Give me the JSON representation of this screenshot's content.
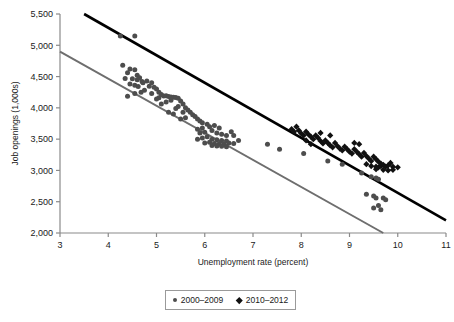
{
  "chart_data": {
    "type": "scatter",
    "title": "",
    "xlabel": "Unemployment rate (percent)",
    "ylabel": "Job openings (1,000s)",
    "xlim": [
      3,
      11
    ],
    "ylim": [
      2000,
      5500
    ],
    "xticks": [
      3,
      4,
      5,
      6,
      7,
      8,
      9,
      10,
      11
    ],
    "xtick_labels": [
      "3",
      "4",
      "5",
      "6",
      "7",
      "8",
      "9",
      "10",
      "11"
    ],
    "yticks": [
      2000,
      2500,
      3000,
      3500,
      4000,
      4500,
      5000,
      5500
    ],
    "ytick_labels": [
      "2,000",
      "2,500",
      "3,000",
      "3,500",
      "4,000",
      "4,500",
      "5,000",
      "5,500"
    ],
    "grid": false,
    "legend_position": "bottom-center",
    "series": [
      {
        "name": "2000–2009",
        "marker": "circle",
        "color": "#4d4d4d",
        "points": [
          [
            4.25,
            5150
          ],
          [
            4.55,
            5150
          ],
          [
            4.3,
            4680
          ],
          [
            4.45,
            4620
          ],
          [
            4.4,
            4560
          ],
          [
            4.55,
            4610
          ],
          [
            4.6,
            4520
          ],
          [
            4.35,
            4470
          ],
          [
            4.5,
            4465
          ],
          [
            4.6,
            4450
          ],
          [
            4.65,
            4480
          ],
          [
            4.7,
            4420
          ],
          [
            4.45,
            4380
          ],
          [
            4.55,
            4360
          ],
          [
            4.62,
            4340
          ],
          [
            4.72,
            4400
          ],
          [
            4.8,
            4430
          ],
          [
            4.85,
            4345
          ],
          [
            4.9,
            4400
          ],
          [
            4.95,
            4330
          ],
          [
            5.0,
            4300
          ],
          [
            4.75,
            4280
          ],
          [
            4.68,
            4250
          ],
          [
            4.55,
            4230
          ],
          [
            4.4,
            4185
          ],
          [
            4.9,
            4230
          ],
          [
            5.05,
            4250
          ],
          [
            5.1,
            4215
          ],
          [
            5.15,
            4190
          ],
          [
            5.2,
            4195
          ],
          [
            5.25,
            4180
          ],
          [
            5.3,
            4175
          ],
          [
            5.35,
            4170
          ],
          [
            5.05,
            4160
          ],
          [
            5.0,
            4140
          ],
          [
            5.4,
            4165
          ],
          [
            5.45,
            4155
          ],
          [
            5.3,
            4120
          ],
          [
            5.2,
            4095
          ],
          [
            5.1,
            4060
          ],
          [
            5.5,
            4110
          ],
          [
            5.55,
            4060
          ],
          [
            5.45,
            4020
          ],
          [
            5.4,
            3990
          ],
          [
            5.6,
            4000
          ],
          [
            5.65,
            3965
          ],
          [
            5.55,
            3930
          ],
          [
            5.35,
            3900
          ],
          [
            5.25,
            3930
          ],
          [
            5.7,
            3930
          ],
          [
            5.75,
            3890
          ],
          [
            5.8,
            3860
          ],
          [
            5.6,
            3840
          ],
          [
            5.5,
            3820
          ],
          [
            5.85,
            3820
          ],
          [
            5.9,
            3790
          ],
          [
            5.95,
            3760
          ],
          [
            6.05,
            3740
          ],
          [
            6.1,
            3700
          ],
          [
            5.95,
            3680
          ],
          [
            5.85,
            3660
          ],
          [
            6.2,
            3720
          ],
          [
            6.3,
            3680
          ],
          [
            6.15,
            3640
          ],
          [
            6.0,
            3610
          ],
          [
            5.9,
            3600
          ],
          [
            6.25,
            3600
          ],
          [
            6.35,
            3580
          ],
          [
            6.45,
            3560
          ],
          [
            6.55,
            3620
          ],
          [
            6.6,
            3560
          ],
          [
            6.05,
            3540
          ],
          [
            5.95,
            3520
          ],
          [
            5.85,
            3500
          ],
          [
            6.15,
            3500
          ],
          [
            6.25,
            3490
          ],
          [
            6.35,
            3480
          ],
          [
            6.45,
            3470
          ],
          [
            6.1,
            3450
          ],
          [
            6.0,
            3440
          ],
          [
            6.2,
            3430
          ],
          [
            6.3,
            3425
          ],
          [
            6.4,
            3420
          ],
          [
            6.5,
            3440
          ],
          [
            6.6,
            3430
          ],
          [
            6.7,
            3480
          ],
          [
            6.15,
            3400
          ],
          [
            6.25,
            3390
          ],
          [
            6.35,
            3385
          ],
          [
            6.45,
            3380
          ],
          [
            7.3,
            3420
          ],
          [
            7.55,
            3340
          ],
          [
            8.05,
            3270
          ],
          [
            8.55,
            3150
          ],
          [
            8.85,
            3100
          ],
          [
            9.25,
            2960
          ],
          [
            9.45,
            2900
          ],
          [
            9.55,
            2880
          ],
          [
            9.6,
            2860
          ],
          [
            9.35,
            2620
          ],
          [
            9.5,
            2590
          ],
          [
            9.55,
            2560
          ],
          [
            9.7,
            2560
          ],
          [
            9.75,
            2530
          ],
          [
            9.6,
            2440
          ],
          [
            9.5,
            2400
          ],
          [
            9.65,
            2370
          ]
        ],
        "trendline": {
          "x": [
            3.0,
            9.7
          ],
          "y": [
            4900,
            2000
          ]
        }
      },
      {
        "name": "2010–2012",
        "marker": "diamond",
        "color": "#111111",
        "points": [
          [
            7.8,
            3660
          ],
          [
            7.85,
            3620
          ],
          [
            7.9,
            3700
          ],
          [
            7.95,
            3640
          ],
          [
            8.0,
            3590
          ],
          [
            8.05,
            3560
          ],
          [
            8.1,
            3620
          ],
          [
            8.15,
            3575
          ],
          [
            8.2,
            3540
          ],
          [
            8.25,
            3500
          ],
          [
            8.1,
            3480
          ],
          [
            8.3,
            3560
          ],
          [
            8.35,
            3520
          ],
          [
            8.4,
            3470
          ],
          [
            8.45,
            3430
          ],
          [
            8.2,
            3420
          ],
          [
            8.5,
            3480
          ],
          [
            8.55,
            3440
          ],
          [
            8.6,
            3400
          ],
          [
            8.65,
            3370
          ],
          [
            8.7,
            3440
          ],
          [
            8.75,
            3390
          ],
          [
            8.8,
            3350
          ],
          [
            8.85,
            3320
          ],
          [
            8.9,
            3380
          ],
          [
            8.95,
            3340
          ],
          [
            9.0,
            3300
          ],
          [
            9.05,
            3270
          ],
          [
            9.1,
            3340
          ],
          [
            9.15,
            3300
          ],
          [
            9.2,
            3260
          ],
          [
            9.25,
            3220
          ],
          [
            9.3,
            3280
          ],
          [
            9.35,
            3230
          ],
          [
            9.4,
            3190
          ],
          [
            9.45,
            3150
          ],
          [
            9.5,
            3220
          ],
          [
            9.55,
            3180
          ],
          [
            9.6,
            3140
          ],
          [
            9.65,
            3110
          ],
          [
            9.35,
            3100
          ],
          [
            9.45,
            3070
          ],
          [
            9.55,
            3060
          ],
          [
            9.6,
            3050
          ],
          [
            9.65,
            3070
          ],
          [
            9.7,
            3090
          ],
          [
            9.75,
            3060
          ],
          [
            9.8,
            3080
          ],
          [
            9.85,
            3120
          ],
          [
            9.9,
            3060
          ],
          [
            9.55,
            3020
          ],
          [
            9.7,
            3010
          ],
          [
            9.8,
            3000
          ],
          [
            9.9,
            3010
          ],
          [
            10.0,
            3050
          ],
          [
            9.1,
            3440
          ],
          [
            9.2,
            3420
          ],
          [
            8.6,
            3560
          ],
          [
            8.4,
            3600
          ]
        ],
        "trendline": {
          "x": [
            3.5,
            11.0
          ],
          "y": [
            5500,
            2200
          ]
        }
      }
    ]
  },
  "legend": {
    "entries": [
      {
        "label": "2000–2009",
        "marker": "circle"
      },
      {
        "label": "2010–2012",
        "marker": "diamond"
      }
    ]
  }
}
